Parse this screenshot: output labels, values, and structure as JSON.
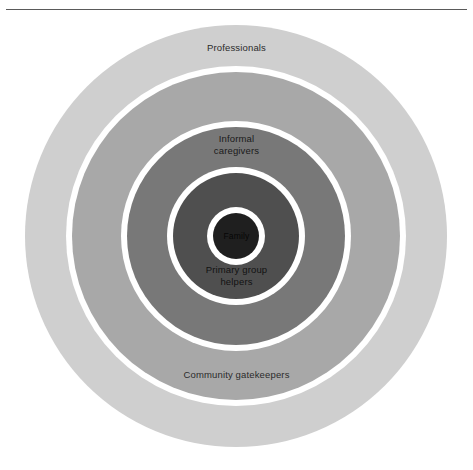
{
  "figure": {
    "type": "concentric-circles-diagram",
    "has_top_rule": true,
    "center": {
      "x": 236,
      "y": 236
    },
    "background_color": "#ffffff",
    "separator_color": "#ffffff"
  },
  "rings": [
    {
      "id": "outer",
      "label_top": "Professionals",
      "label_bottom": "Community gatekeepers",
      "color": "#cfcfcf",
      "radius": 211,
      "level": 5
    },
    {
      "id": "caregivers",
      "label": "Informal\ncaregivers",
      "color": "#a8a8a8",
      "radius": 164,
      "level": 4
    },
    {
      "id": "helpers",
      "label": "Primary group\nhelpers",
      "color": "#787878",
      "radius": 109,
      "level": 3
    },
    {
      "id": "inner-field",
      "label": "",
      "color": "#4f4f4f",
      "radius": 63,
      "level": 2
    },
    {
      "id": "family",
      "label": "Family",
      "color": "#1f1f1f",
      "radius": 23,
      "level": 1
    }
  ],
  "labels": {
    "professionals": "Professionals",
    "informal_caregivers": "Informal\ncaregivers",
    "primary_group_helpers": "Primary group\nhelpers",
    "community_gatekeepers": "Community gatekeepers",
    "family": "Family"
  }
}
